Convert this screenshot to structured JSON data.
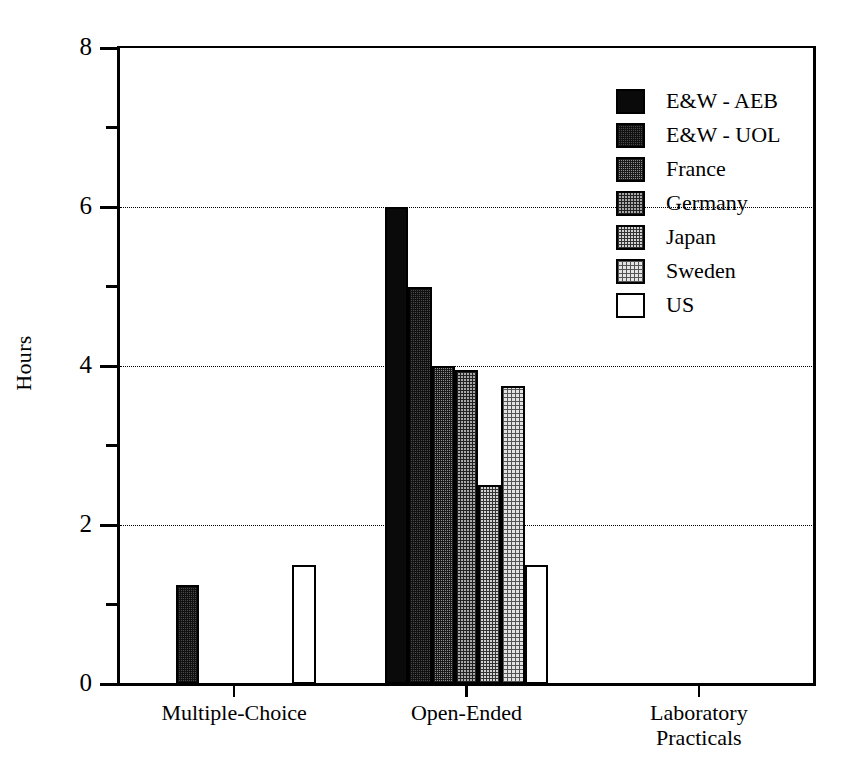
{
  "chart_data": {
    "type": "bar",
    "title": "",
    "xlabel": "",
    "ylabel": "Hours",
    "ylim": [
      0,
      8
    ],
    "ytick_labels": [
      "0",
      "2",
      "4",
      "6",
      "8"
    ],
    "ytick_values": [
      0,
      2,
      4,
      6,
      8
    ],
    "yticks_minor": [
      1,
      3,
      5,
      7
    ],
    "gridlines": [
      2,
      4,
      6
    ],
    "grid": true,
    "legend_position": "top-right",
    "categories": [
      "Multiple-Choice",
      "Open-Ended",
      "Laboratory Practicals"
    ],
    "category_lines": [
      [
        "Multiple-Choice"
      ],
      [
        "Open-Ended"
      ],
      [
        "Laboratory",
        "Practicals"
      ]
    ],
    "series": [
      {
        "name": "E&W - AEB",
        "key": "aeb",
        "values": [
          0,
          6.0,
          0
        ]
      },
      {
        "name": "E&W - UOL",
        "key": "uol",
        "values": [
          1.25,
          5.0,
          0
        ]
      },
      {
        "name": "France",
        "key": "france",
        "values": [
          0,
          4.0,
          0
        ]
      },
      {
        "name": "Germany",
        "key": "germany",
        "values": [
          0,
          3.95,
          0
        ]
      },
      {
        "name": "Japan",
        "key": "japan",
        "values": [
          0,
          2.5,
          0
        ]
      },
      {
        "name": "Sweden",
        "key": "sweden",
        "values": [
          0,
          3.75,
          0
        ]
      },
      {
        "name": "US",
        "key": "us",
        "values": [
          1.5,
          1.5,
          0
        ]
      }
    ]
  },
  "legend": {
    "items": [
      {
        "label": "E&W - AEB",
        "key": "aeb"
      },
      {
        "label": "E&W - UOL",
        "key": "uol"
      },
      {
        "label": "France",
        "key": "france"
      },
      {
        "label": "Germany",
        "key": "germany"
      },
      {
        "label": "Japan",
        "key": "japan"
      },
      {
        "label": "Sweden",
        "key": "sweden"
      },
      {
        "label": "US",
        "key": "us"
      }
    ]
  },
  "colors": {
    "axis": "#000000",
    "grid": "#000000",
    "background": "#ffffff"
  }
}
